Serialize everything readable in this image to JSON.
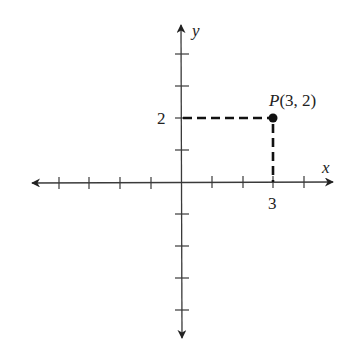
{
  "diagram": {
    "type": "coordinate-plane",
    "axes": {
      "x_label": "x",
      "y_label": "y",
      "x_ticks": [
        -5,
        -4,
        -3,
        -2,
        -1,
        1,
        2,
        3,
        4
      ],
      "y_ticks": [
        4,
        3,
        2,
        1,
        -1,
        -2,
        -3,
        -4
      ],
      "labeled_x_tick": "3",
      "labeled_y_tick": "2"
    },
    "point": {
      "name": "P",
      "x": 3,
      "y": 2,
      "label": "P(3, 2)",
      "label_name": "P",
      "label_coords": "(3, 2)"
    },
    "guides": "dashed lines from point to each axis",
    "colors": {
      "axis": "#3a3a3a",
      "point": "#111111",
      "background": "#ffffff"
    }
  }
}
